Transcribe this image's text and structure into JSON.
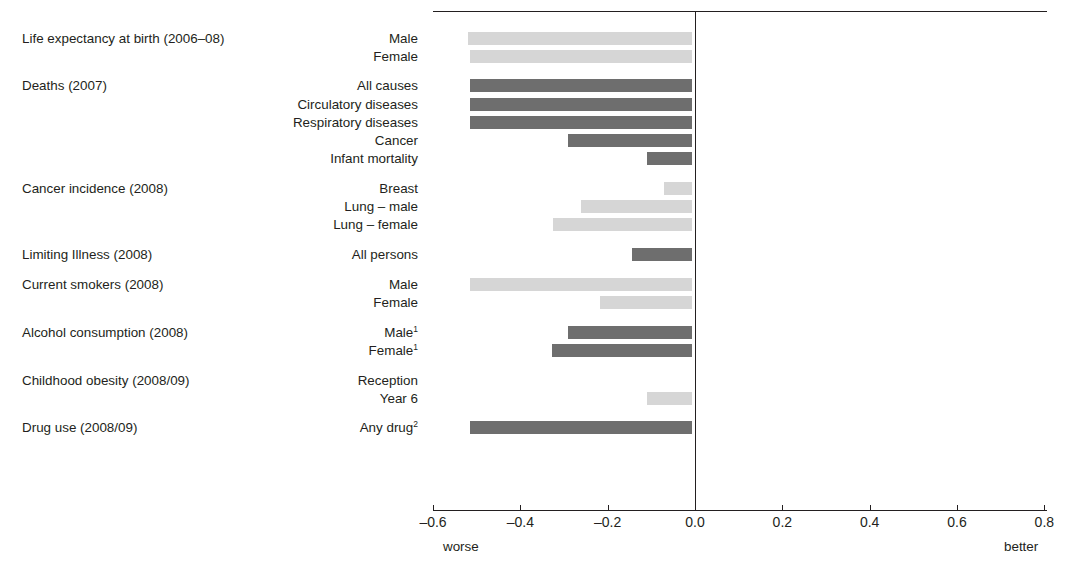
{
  "figure": {
    "title_remnant": "",
    "axis": {
      "ticks": [
        "–0.6",
        "–0.4",
        "–0.2",
        "0.0",
        "0.2",
        "0.4",
        "0.6",
        "0.8"
      ],
      "tick_values": [
        -0.6,
        -0.4,
        -0.2,
        0.0,
        0.2,
        0.4,
        0.6,
        0.8
      ],
      "caption_left": "worse",
      "caption_right": "better"
    }
  },
  "chart_data": {
    "type": "bar",
    "orientation": "horizontal",
    "title": "",
    "xlabel": "",
    "ylabel": "",
    "xlim": [
      -0.6,
      0.8
    ],
    "grid": false,
    "legend": "none",
    "annotations": {
      "left_end": "worse",
      "right_end": "better"
    },
    "colors": {
      "dark": "#6e6e6e",
      "light": "#d6d6d6",
      "axis": "#231f20",
      "background": "#ffffff"
    },
    "footnote_markers": [
      "1",
      "2"
    ],
    "groups": [
      {
        "group": "Life expectancy at birth (2006–08)",
        "items": [
          {
            "label": "Male",
            "value": -0.52,
            "shade": "light"
          },
          {
            "label": "Female",
            "value": -0.515,
            "shade": "light"
          }
        ]
      },
      {
        "group": "Deaths (2007)",
        "items": [
          {
            "label": "All causes",
            "value": -0.515,
            "shade": "dark"
          },
          {
            "label": "Circulatory diseases",
            "value": -0.515,
            "shade": "dark"
          },
          {
            "label": "Respiratory diseases",
            "value": -0.515,
            "shade": "dark"
          },
          {
            "label": "Cancer",
            "value": -0.29,
            "shade": "dark"
          },
          {
            "label": "Infant mortality",
            "value": -0.11,
            "shade": "dark"
          }
        ]
      },
      {
        "group": "Cancer incidence (2008)",
        "items": [
          {
            "label": "Breast",
            "value": -0.07,
            "shade": "light"
          },
          {
            "label": "Lung – male",
            "value": -0.26,
            "shade": "light"
          },
          {
            "label": "Lung – female",
            "value": -0.325,
            "shade": "light"
          }
        ]
      },
      {
        "group": "Limiting Illness (2008)",
        "items": [
          {
            "label": "All persons",
            "value": -0.145,
            "shade": "dark"
          }
        ]
      },
      {
        "group": "Current smokers (2008)",
        "items": [
          {
            "label": "Male",
            "value": -0.515,
            "shade": "light"
          },
          {
            "label": "Female",
            "value": -0.218,
            "shade": "light"
          }
        ]
      },
      {
        "group": "Alcohol consumption (2008)",
        "items": [
          {
            "label": "Male",
            "footnote": "1",
            "value": -0.29,
            "shade": "dark"
          },
          {
            "label": "Female",
            "footnote": "1",
            "value": -0.328,
            "shade": "dark"
          }
        ]
      },
      {
        "group": "Childhood obesity (2008/09)",
        "items": [
          {
            "label": "Reception",
            "value": 0.0,
            "shade": "light"
          },
          {
            "label": "Year 6",
            "value": -0.11,
            "shade": "light"
          }
        ]
      },
      {
        "group": "Drug use (2008/09)",
        "items": [
          {
            "label": "Any drug",
            "footnote": "2",
            "value": -0.515,
            "shade": "dark"
          }
        ]
      }
    ]
  }
}
